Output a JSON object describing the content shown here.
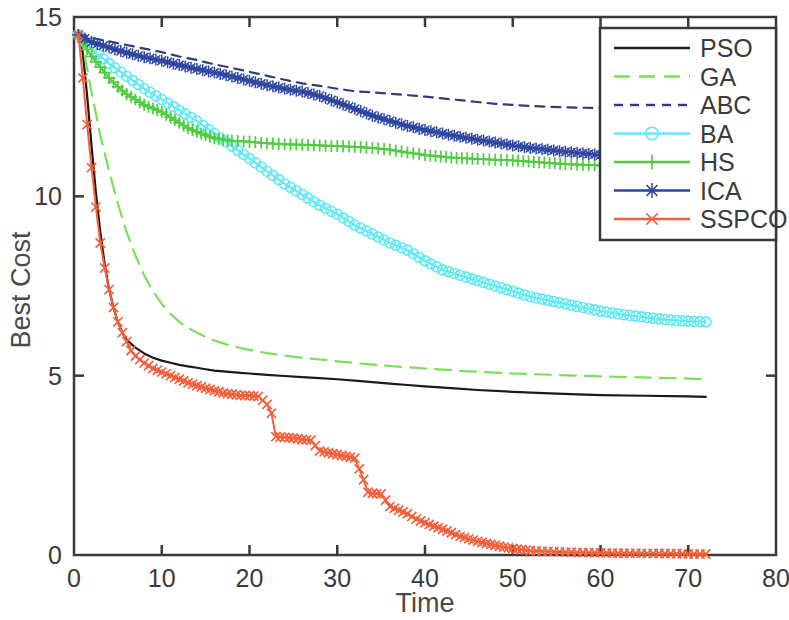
{
  "chart_data": {
    "type": "line",
    "title": "",
    "xlabel": "Time",
    "ylabel": "Best Cost",
    "xlim": [
      0,
      80
    ],
    "ylim": [
      0,
      15
    ],
    "xticks": [
      0,
      10,
      20,
      30,
      40,
      50,
      60,
      70,
      80
    ],
    "yticks": [
      0,
      5,
      10,
      15
    ],
    "xtick_labels": [
      "0",
      "10",
      "20",
      "30",
      "40",
      "50",
      "60",
      "70",
      "80"
    ],
    "ytick_labels": [
      "0",
      "5",
      "10",
      "15"
    ],
    "grid": false,
    "legend_position": "top-right",
    "series": [
      {
        "name": "PSO",
        "color": "#1a1a1a",
        "style": "solid",
        "marker": "none",
        "x": [
          0.5,
          1,
          1.5,
          2,
          2.5,
          3,
          3.5,
          4,
          4.5,
          5,
          5.5,
          6,
          7,
          8,
          9,
          10,
          11,
          12,
          13,
          14,
          15,
          16,
          17,
          18,
          19,
          20,
          22,
          24,
          26,
          28,
          30,
          32,
          34,
          36,
          38,
          40,
          43,
          46,
          50,
          55,
          60,
          65,
          70,
          72
        ],
        "y": [
          14.6,
          14.0,
          12.8,
          11.4,
          10.1,
          9.0,
          8.1,
          7.4,
          6.9,
          6.5,
          6.2,
          6.0,
          5.78,
          5.62,
          5.5,
          5.42,
          5.36,
          5.3,
          5.26,
          5.22,
          5.18,
          5.14,
          5.12,
          5.1,
          5.08,
          5.06,
          5.02,
          4.99,
          4.96,
          4.93,
          4.9,
          4.86,
          4.82,
          4.78,
          4.74,
          4.7,
          4.65,
          4.6,
          4.55,
          4.5,
          4.46,
          4.44,
          4.42,
          4.41
        ]
      },
      {
        "name": "GA",
        "color": "#7ede5c",
        "style": "dashed",
        "marker": "none",
        "x": [
          0.5,
          1,
          2,
          3,
          4,
          5,
          6,
          7,
          8,
          9,
          10,
          11,
          12,
          13,
          14,
          15,
          16,
          17,
          18,
          19,
          20,
          22,
          24,
          26,
          28,
          30,
          33,
          36,
          40,
          45,
          50,
          55,
          60,
          65,
          70,
          72
        ],
        "y": [
          14.6,
          14.2,
          12.9,
          11.7,
          10.7,
          9.8,
          9.0,
          8.35,
          7.8,
          7.35,
          7.0,
          6.72,
          6.5,
          6.33,
          6.2,
          6.08,
          5.98,
          5.9,
          5.83,
          5.77,
          5.72,
          5.63,
          5.56,
          5.5,
          5.45,
          5.4,
          5.33,
          5.27,
          5.2,
          5.12,
          5.06,
          5.02,
          4.98,
          4.95,
          4.92,
          4.9
        ]
      },
      {
        "name": "ABC",
        "color": "#2f3c7a",
        "style": "dotted",
        "marker": "none",
        "x": [
          0.5,
          2,
          4,
          6,
          8,
          10,
          12,
          14,
          16,
          18,
          20,
          22,
          24,
          26,
          28,
          30,
          32,
          34,
          36,
          38,
          40,
          42,
          44,
          46,
          48,
          50,
          52,
          54,
          56,
          58,
          60
        ],
        "y": [
          14.55,
          14.42,
          14.32,
          14.22,
          14.12,
          14.02,
          13.9,
          13.8,
          13.68,
          13.58,
          13.47,
          13.36,
          13.25,
          13.15,
          13.08,
          13.0,
          12.93,
          12.9,
          12.86,
          12.82,
          12.78,
          12.73,
          12.68,
          12.63,
          12.58,
          12.55,
          12.52,
          12.5,
          12.48,
          12.47,
          12.46
        ]
      },
      {
        "name": "BA",
        "color": "#5fe8f5",
        "style": "solid",
        "marker": "circle",
        "x": [
          0.5,
          2,
          4,
          6,
          8,
          10,
          12,
          14,
          16,
          18,
          20,
          22,
          24,
          26,
          28,
          30,
          32,
          34,
          36,
          38,
          40,
          42,
          44,
          46,
          48,
          50,
          52,
          54,
          56,
          58,
          60,
          62,
          64,
          66,
          68,
          70,
          72
        ],
        "y": [
          14.5,
          14.1,
          13.7,
          13.35,
          13.0,
          12.7,
          12.4,
          12.1,
          11.75,
          11.4,
          11.05,
          10.7,
          10.35,
          10.05,
          9.75,
          9.5,
          9.2,
          8.95,
          8.7,
          8.5,
          8.2,
          7.95,
          7.8,
          7.65,
          7.5,
          7.35,
          7.2,
          7.1,
          7.0,
          6.9,
          6.8,
          6.72,
          6.66,
          6.6,
          6.55,
          6.52,
          6.5
        ]
      },
      {
        "name": "HS",
        "color": "#4fcc3f",
        "style": "solid",
        "marker": "plus",
        "x": [
          0.5,
          1,
          2,
          3,
          4,
          5,
          6,
          7,
          8,
          9,
          10,
          11,
          12,
          13,
          14,
          15,
          16,
          17,
          18,
          20,
          22,
          24,
          26,
          28,
          30,
          32,
          34,
          36,
          38,
          40,
          43,
          46,
          50,
          53,
          56,
          58,
          60
        ],
        "y": [
          14.5,
          14.3,
          13.9,
          13.6,
          13.3,
          13.05,
          12.85,
          12.7,
          12.55,
          12.45,
          12.35,
          12.2,
          12.05,
          11.9,
          11.8,
          11.7,
          11.62,
          11.58,
          11.55,
          11.52,
          11.48,
          11.45,
          11.44,
          11.42,
          11.4,
          11.38,
          11.35,
          11.3,
          11.22,
          11.15,
          11.08,
          11.04,
          11.0,
          10.95,
          10.9,
          10.88,
          10.86
        ]
      },
      {
        "name": "ICA",
        "color": "#2e46a0",
        "style": "solid",
        "marker": "star",
        "x": [
          0.5,
          2,
          4,
          6,
          8,
          10,
          12,
          14,
          16,
          18,
          20,
          22,
          24,
          26,
          28,
          30,
          32,
          34,
          36,
          38,
          40,
          42,
          44,
          46,
          48,
          50,
          52,
          54,
          56,
          58,
          60
        ],
        "y": [
          14.5,
          14.3,
          14.15,
          14.0,
          13.88,
          13.78,
          13.66,
          13.55,
          13.45,
          13.34,
          13.22,
          13.1,
          13.0,
          12.92,
          12.8,
          12.62,
          12.44,
          12.25,
          12.1,
          11.96,
          11.85,
          11.75,
          11.66,
          11.58,
          11.5,
          11.42,
          11.35,
          11.3,
          11.24,
          11.2,
          11.15
        ]
      },
      {
        "name": "SSPCO",
        "color": "#f0603c",
        "style": "solid",
        "marker": "x",
        "x": [
          0.5,
          1,
          1.5,
          2,
          2.5,
          3,
          3.5,
          4,
          4.5,
          5,
          5.5,
          6,
          6.5,
          7,
          8,
          9,
          10,
          11,
          12,
          13,
          14,
          15,
          16,
          17,
          18,
          19,
          20,
          21,
          22,
          22.5,
          23,
          24,
          25,
          26,
          27,
          28,
          29,
          30,
          31,
          32,
          33,
          33.5,
          34,
          35,
          36,
          37,
          38,
          39,
          40,
          41,
          42,
          43,
          44,
          45,
          46,
          47,
          48,
          49,
          50,
          51,
          52,
          54,
          56,
          58,
          60,
          62,
          64,
          66,
          68,
          70,
          72
        ],
        "y": [
          14.5,
          13.3,
          12.0,
          10.8,
          9.7,
          8.7,
          8.0,
          7.4,
          6.9,
          6.5,
          6.2,
          5.95,
          5.7,
          5.55,
          5.35,
          5.2,
          5.1,
          5.0,
          4.9,
          4.8,
          4.72,
          4.65,
          4.58,
          4.52,
          4.48,
          4.45,
          4.44,
          4.42,
          4.2,
          3.95,
          3.3,
          3.28,
          3.26,
          3.22,
          3.2,
          2.9,
          2.85,
          2.8,
          2.75,
          2.7,
          2.1,
          1.75,
          1.72,
          1.7,
          1.35,
          1.25,
          1.15,
          1.0,
          0.9,
          0.8,
          0.72,
          0.62,
          0.52,
          0.45,
          0.38,
          0.32,
          0.27,
          0.22,
          0.18,
          0.15,
          0.12,
          0.1,
          0.08,
          0.07,
          0.06,
          0.05,
          0.05,
          0.04,
          0.04,
          0.03,
          0.03
        ]
      }
    ]
  },
  "legend": {
    "entries": [
      {
        "label": "PSO"
      },
      {
        "label": "GA"
      },
      {
        "label": "ABC"
      },
      {
        "label": "BA"
      },
      {
        "label": "HS"
      },
      {
        "label": "ICA"
      },
      {
        "label": "SSPCO"
      }
    ]
  }
}
